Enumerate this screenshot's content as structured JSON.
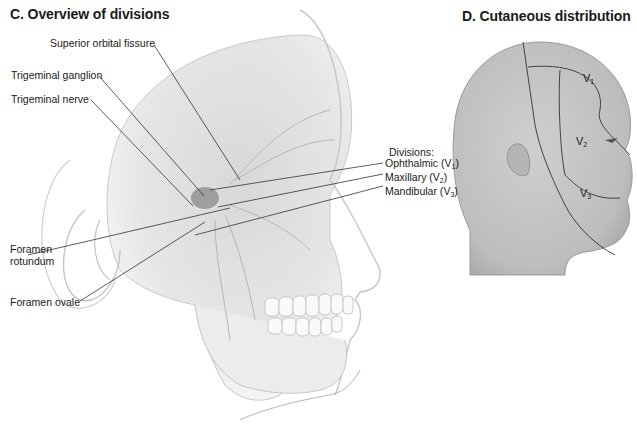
{
  "panel_c": {
    "title": "C. Overview of divisions",
    "labels": {
      "superior_orbital_fissure": "Superior orbital fissure",
      "trigeminal_ganglion": "Trigeminal ganglion",
      "trigeminal_nerve": "Trigeminal nerve",
      "foramen_rotundum_1": "Foramen",
      "foramen_rotundum_2": "rotundum",
      "foramen_ovale": "Foramen ovale"
    },
    "divisions": {
      "heading": "Divisions:",
      "items": [
        {
          "name": "Ophthalmic",
          "code": "V",
          "sub": "1"
        },
        {
          "name": "Maxillary",
          "code": "V",
          "sub": "2"
        },
        {
          "name": "Mandibular",
          "code": "V",
          "sub": "3"
        }
      ]
    }
  },
  "panel_d": {
    "title": "D. Cutaneous distribution",
    "zones": [
      {
        "code": "V",
        "sub": "1"
      },
      {
        "code": "V",
        "sub": "2"
      },
      {
        "code": "V",
        "sub": "3"
      }
    ]
  }
}
